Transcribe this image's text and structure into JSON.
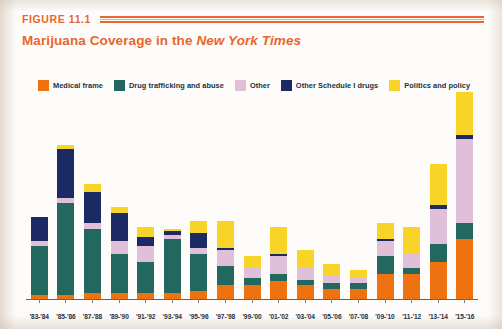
{
  "figure": {
    "number_label": "FIGURE 11.1",
    "title_plain": "Marijuana Coverage in the ",
    "title_italic": "New York Times"
  },
  "colors": {
    "medical_frame": "#ef7211",
    "drug_trafficking": "#23685f",
    "other": "#dfc0d8",
    "other_schedule_i": "#1b2a63",
    "politics_and_policy": "#f8d428",
    "accent_orange": "#e8662a",
    "axis": "#6f6152",
    "page_background": "#fdfcfa"
  },
  "legend": {
    "items": [
      {
        "label": "Medical frame",
        "color": "#ef7211",
        "key": "medical_frame"
      },
      {
        "label": "Drug trafficking and abuse",
        "color": "#23685f",
        "key": "drug_trafficking"
      },
      {
        "label": "Other",
        "color": "#dfc0d8",
        "key": "other"
      },
      {
        "label": "Other Schedule I drugs",
        "color": "#1b2a63",
        "key": "other_schedule_i"
      },
      {
        "label": "Politics and policy",
        "color": "#f8d428",
        "key": "politics_and_policy"
      }
    ]
  },
  "chart_data": {
    "type": "bar",
    "stacked": true,
    "title": "Marijuana Coverage in the New York Times",
    "subtitle": "",
    "xlabel": "",
    "ylabel": "",
    "grid": false,
    "legend_position": "top",
    "ylim": [
      0,
      100
    ],
    "axis_ticks_visible": true,
    "y_axis_visible": false,
    "categories": [
      "'83-'84",
      "'85-'86",
      "'87-'88",
      "'89-'90",
      "'91-'92",
      "'93-'94",
      "'95-'96",
      "'97-'98",
      "'99-'00",
      "'01-'02",
      "'03-'04",
      "'05-'06",
      "'07-'08",
      "'09-'10",
      "'11-'12",
      "'13-'14",
      "'15-'16"
    ],
    "series": [
      {
        "name": "Medical frame",
        "color": "#ef7211",
        "values": [
          2,
          2,
          3,
          3,
          3,
          3,
          4,
          7,
          7,
          9,
          7,
          5,
          5,
          13,
          13,
          19,
          31
        ]
      },
      {
        "name": "Drug trafficking and abuse",
        "color": "#23685f",
        "values": [
          25,
          47,
          33,
          20,
          16,
          28,
          19,
          10,
          4,
          4,
          3,
          3,
          3,
          9,
          3,
          9,
          8
        ]
      },
      {
        "name": "Other",
        "color": "#dfc0d8",
        "values": [
          3,
          3,
          3,
          7,
          8,
          2,
          3,
          8,
          5,
          9,
          6,
          4,
          3,
          8,
          7,
          18,
          43
        ]
      },
      {
        "name": "Other Schedule I drugs",
        "color": "#1b2a63",
        "values": [
          12,
          25,
          16,
          14,
          5,
          2,
          8,
          1,
          0,
          1,
          0,
          0,
          0,
          1,
          0,
          2,
          2
        ]
      },
      {
        "name": "Politics and policy",
        "color": "#f8d428",
        "values": [
          0,
          2,
          4,
          3,
          5,
          1,
          6,
          14,
          6,
          14,
          9,
          6,
          4,
          8,
          14,
          21,
          22
        ]
      }
    ]
  }
}
